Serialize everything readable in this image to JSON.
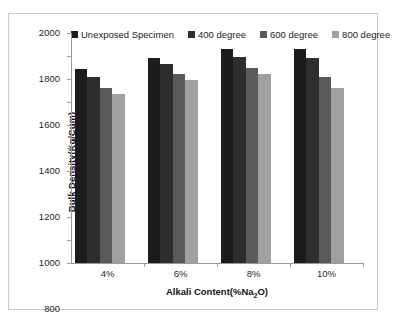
{
  "chart_data": {
    "type": "bar",
    "title": "",
    "subtitle": "",
    "xlabel": "Alkali Content(%Na2O)",
    "xlabel_prefix": "Alkali Content(%Na",
    "xlabel_sub": "2",
    "xlabel_suffix": "O)",
    "ylabel": "Bulk Density(Kg/Cum)",
    "categories": [
      "4%",
      "6%",
      "8%",
      "10%"
    ],
    "ylim": [
      0,
      2000
    ],
    "ytick_step": 200,
    "yticks": [
      0,
      200,
      400,
      600,
      800,
      1000,
      1200,
      1400,
      1600,
      1800,
      2000
    ],
    "ytick_labels": [
      "0",
      "200",
      "400",
      "600",
      "800",
      "1000",
      "1200",
      "1400",
      "1600",
      "1800",
      "2000"
    ],
    "grid": false,
    "legend_position": "top",
    "series": [
      {
        "name": "Unexposed Specimen",
        "color": "#1c1c1c",
        "values": [
          1690,
          1780,
          1860,
          1860
        ]
      },
      {
        "name": "400 degree",
        "color": "#2e2e2e",
        "values": [
          1620,
          1730,
          1790,
          1780
        ]
      },
      {
        "name": "600 degree",
        "color": "#5a5a5a",
        "values": [
          1520,
          1640,
          1700,
          1620
        ]
      },
      {
        "name": "800 degree",
        "color": "#a0a0a0",
        "values": [
          1470,
          1590,
          1640,
          1520
        ]
      }
    ]
  }
}
